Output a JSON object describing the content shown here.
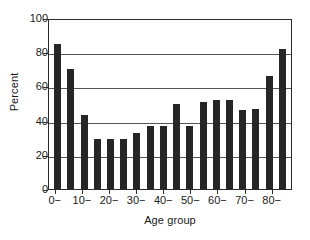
{
  "chart_data": {
    "type": "bar",
    "title": "",
    "xlabel": "Age group",
    "ylabel": "Percent",
    "ylim": [
      0,
      100
    ],
    "yticks": [
      0,
      20,
      40,
      60,
      80,
      100
    ],
    "ytick_labels": [
      "0",
      "20",
      "40",
      "60",
      "80",
      "100"
    ],
    "grid": true,
    "legend": null,
    "categories": [
      "0−",
      "5−",
      "10−",
      "15−",
      "20−",
      "25−",
      "30−",
      "35−",
      "40−",
      "45−",
      "50−",
      "55−",
      "60−",
      "65−",
      "70−",
      "75−",
      "80−",
      "85−"
    ],
    "xtick_labels": [
      "0−",
      "10−",
      "20−",
      "30−",
      "40−",
      "50−",
      "60−",
      "70−",
      "80−"
    ],
    "values": [
      85,
      70,
      43,
      29,
      29,
      29,
      33,
      37,
      37,
      50,
      37,
      51,
      52,
      52,
      46,
      47,
      66,
      82
    ],
    "bar_color": "#262626",
    "axis_color": "#2b2b2b",
    "grid_color": "#555555",
    "background": "#ffffff"
  }
}
